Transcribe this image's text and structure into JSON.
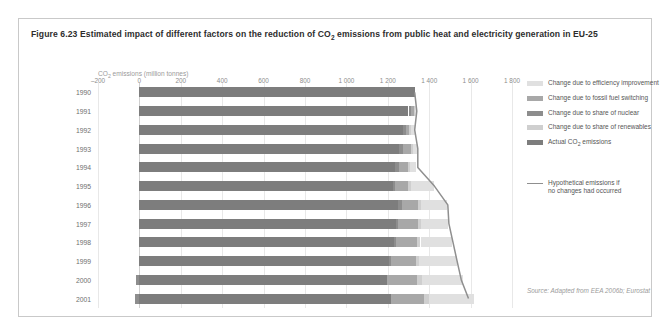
{
  "figure": {
    "title_prefix": "Figure 6.23 Estimated impact of different factors on the reduction of CO",
    "title_sub": "2",
    "title_suffix": " emissions from public heat and electricity generation in EU-25",
    "axis_unit_prefix": "CO",
    "axis_unit_sub": "2",
    "axis_unit_suffix": " emissions (million tonnes)",
    "source": "Source: Adapted from EEA 2006b; Eurostat"
  },
  "legend": {
    "items": [
      {
        "label": "Change due to efficiency improvement",
        "color": "#e0e0e0"
      },
      {
        "label": "Change due to fossil fuel switching",
        "color": "#a8a8a8"
      },
      {
        "label": "Change due to share of nuclear",
        "color": "#8d8d8d"
      },
      {
        "label": "Change due to share of renewables",
        "color": "#cfcfcf"
      },
      {
        "label": "Actual CO",
        "label_sub": "2",
        "label_suffix": " emissions",
        "color": "#7d7d7d"
      }
    ],
    "hypothetical_line_1": "Hypothetical emissions if",
    "hypothetical_line_2": "no changes had occurred",
    "hypothetical_color": "#8f8f8f"
  },
  "chart_data": {
    "type": "bar",
    "title": "Figure 6.23 Estimated impact of different factors on the reduction of CO2 emissions from public heat and electricity generation in EU-25",
    "subtitle": "",
    "orientation": "horizontal-stacked",
    "xlabel": "CO2 emissions (million tonnes)",
    "ylabel": "",
    "xlim": [
      -200,
      1800
    ],
    "xticks": [
      -200,
      0,
      200,
      400,
      600,
      800,
      1000,
      1200,
      1400,
      1600,
      1800
    ],
    "xtick_labels": [
      "–200",
      "0",
      "200",
      "400",
      "600",
      "800",
      "1 000",
      "1 200",
      "1 400",
      "1 600",
      "1 800"
    ],
    "grid": true,
    "legend_position": "right",
    "categories": [
      "1990",
      "1991",
      "1992",
      "1993",
      "1994",
      "1995",
      "1996",
      "1997",
      "1998",
      "1999",
      "2000",
      "2001"
    ],
    "series": [
      {
        "name": "Actual CO2 emissions",
        "color": "#7d7d7d",
        "values": [
          1330,
          1300,
          1272,
          1255,
          1235,
          1225,
          1250,
          1240,
          1230,
          1205,
          1195,
          1215
        ]
      },
      {
        "name": "Change due to share of nuclear",
        "color": "#8d8d8d",
        "values": [
          0,
          14,
          16,
          18,
          20,
          12,
          20,
          10,
          12,
          10,
          -18,
          -20
        ]
      },
      {
        "name": "Change due to fossil fuel switching",
        "color": "#a8a8a8",
        "values": [
          0,
          12,
          16,
          38,
          42,
          62,
          75,
          95,
          100,
          120,
          148,
          160
        ]
      },
      {
        "name": "Change due to share of renewables",
        "color": "#cfcfcf",
        "values": [
          0,
          6,
          8,
          10,
          10,
          12,
          14,
          16,
          16,
          18,
          20,
          22
        ]
      },
      {
        "name": "Change due to efficiency improvement",
        "color": "#e0e0e0",
        "values": [
          0,
          8,
          18,
          22,
          30,
          110,
          125,
          130,
          150,
          180,
          200,
          218
        ]
      }
    ],
    "hypothetical_emissions": {
      "name": "Hypothetical emissions if no changes had occurred",
      "color": "#8f8f8f",
      "values": [
        1330,
        1340,
        1330,
        1345,
        1345,
        1425,
        1490,
        1495,
        1515,
        1535,
        1555,
        1590
      ]
    }
  }
}
